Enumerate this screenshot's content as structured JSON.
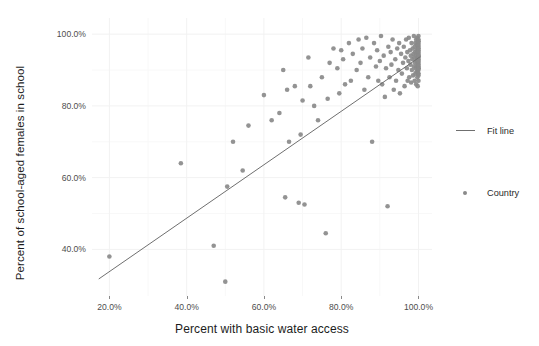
{
  "chart_data": {
    "type": "scatter",
    "title": "",
    "xlabel": "Percent with basic water access",
    "ylabel": "Percent of school-aged females in school",
    "xlim": [
      0.155,
      1.035
    ],
    "ylim": [
      0.27,
      1.045
    ],
    "xticks": [
      0.2,
      0.4,
      0.6,
      0.8,
      1.0
    ],
    "xticklabels": [
      "20.0%",
      "40.0%",
      "60.0%",
      "80.0%",
      "100.0%"
    ],
    "yticks": [
      0.4,
      0.6,
      0.8,
      1.0
    ],
    "yticklabels": [
      "40.0%",
      "60.0%",
      "80.0%",
      "100.0%"
    ],
    "grid": true,
    "grid_color": "#f2f2f2",
    "point_color": "#8a8a8a",
    "line_color": "#6f6f6f",
    "legend_position": "right",
    "series": [
      {
        "name": "Country",
        "marker": "circle",
        "x": [
          0.2,
          0.385,
          0.47,
          0.5,
          0.505,
          0.52,
          0.545,
          0.56,
          0.6,
          0.62,
          0.64,
          0.65,
          0.655,
          0.66,
          0.665,
          0.68,
          0.69,
          0.695,
          0.7,
          0.705,
          0.715,
          0.72,
          0.73,
          0.74,
          0.75,
          0.76,
          0.765,
          0.77,
          0.78,
          0.79,
          0.795,
          0.8,
          0.805,
          0.81,
          0.82,
          0.825,
          0.83,
          0.84,
          0.845,
          0.85,
          0.855,
          0.86,
          0.865,
          0.87,
          0.875,
          0.88,
          0.885,
          0.89,
          0.893,
          0.896,
          0.9,
          0.903,
          0.906,
          0.91,
          0.913,
          0.916,
          0.92,
          0.922,
          0.925,
          0.928,
          0.93,
          0.933,
          0.936,
          0.94,
          0.942,
          0.945,
          0.948,
          0.95,
          0.952,
          0.955,
          0.957,
          0.96,
          0.962,
          0.964,
          0.966,
          0.968,
          0.97,
          0.971,
          0.972,
          0.974,
          0.975,
          0.976,
          0.978,
          0.979,
          0.98,
          0.981,
          0.982,
          0.983,
          0.984,
          0.985,
          0.986,
          0.987,
          0.988,
          0.988,
          0.989,
          0.99,
          0.99,
          0.991,
          0.991,
          0.992,
          0.992,
          0.993,
          0.993,
          0.994,
          0.994,
          0.995,
          0.995,
          0.995,
          0.996,
          0.996,
          0.996,
          0.997,
          0.997,
          0.997,
          0.997,
          0.998,
          0.998,
          0.998,
          0.998,
          0.998,
          0.999,
          0.999,
          0.999,
          0.999,
          0.999,
          0.999,
          1.0,
          1.0,
          1.0,
          1.0,
          1.0,
          1.0,
          1.0,
          1.0,
          1.0,
          1.0,
          1.0,
          1.0,
          1.0,
          1.0,
          1.0,
          1.0,
          1.0,
          1.0,
          1.0,
          1.0,
          1.0,
          1.0,
          1.0,
          1.0
        ],
        "y": [
          0.38,
          0.64,
          0.41,
          0.31,
          0.575,
          0.7,
          0.62,
          0.745,
          0.83,
          0.76,
          0.78,
          0.9,
          0.545,
          0.845,
          0.7,
          0.855,
          0.53,
          0.72,
          0.815,
          0.525,
          0.935,
          0.855,
          0.8,
          0.76,
          0.88,
          0.445,
          0.82,
          0.92,
          0.96,
          0.905,
          0.835,
          0.955,
          0.93,
          0.86,
          0.975,
          0.87,
          0.945,
          0.9,
          0.985,
          0.92,
          0.96,
          0.845,
          0.99,
          0.88,
          0.935,
          0.7,
          0.975,
          0.91,
          0.955,
          0.87,
          0.925,
          0.995,
          0.86,
          0.94,
          0.825,
          0.905,
          0.52,
          0.965,
          0.88,
          0.95,
          0.915,
          0.985,
          0.845,
          0.93,
          0.87,
          0.96,
          0.9,
          0.975,
          0.835,
          0.945,
          0.89,
          0.92,
          0.965,
          0.855,
          0.935,
          0.985,
          0.905,
          0.95,
          0.87,
          0.925,
          0.99,
          0.88,
          0.955,
          0.915,
          0.94,
          0.865,
          0.975,
          0.9,
          0.93,
          0.96,
          0.885,
          0.945,
          0.91,
          0.995,
          0.935,
          0.87,
          0.965,
          0.92,
          0.95,
          0.89,
          0.975,
          0.905,
          0.94,
          0.86,
          0.985,
          0.925,
          0.955,
          0.895,
          0.93,
          0.97,
          0.91,
          0.945,
          0.88,
          0.99,
          0.92,
          0.96,
          0.9,
          0.935,
          0.975,
          0.855,
          0.915,
          0.95,
          0.89,
          0.98,
          0.925,
          0.96,
          0.905,
          0.94,
          0.87,
          0.995,
          0.93,
          0.965,
          0.91,
          0.885,
          0.945,
          0.975,
          0.92,
          0.955,
          0.9,
          0.985,
          0.935,
          0.97,
          0.915,
          0.89,
          0.95,
          0.925,
          0.96,
          0.94,
          0.905,
          0.98
        ]
      }
    ],
    "fit_line": {
      "name": "Fit line",
      "x0": 0.1725,
      "y0": 0.3175,
      "x1": 1.005,
      "y1": 0.9375
    }
  },
  "legend": {
    "items": [
      {
        "label": "Fit line",
        "key": "line",
        "color": "#6f6f6f"
      },
      {
        "label": "Country",
        "key": "dot",
        "color": "#8a8a8a"
      }
    ]
  },
  "axes": {
    "x": {
      "title": "Percent with basic water access",
      "ticklabels": [
        "20.0%",
        "40.0%",
        "60.0%",
        "80.0%",
        "100.0%"
      ]
    },
    "y": {
      "title": "Percent of school-aged females in school",
      "ticklabels": [
        "40.0%",
        "60.0%",
        "80.0%",
        "100.0%"
      ]
    }
  }
}
